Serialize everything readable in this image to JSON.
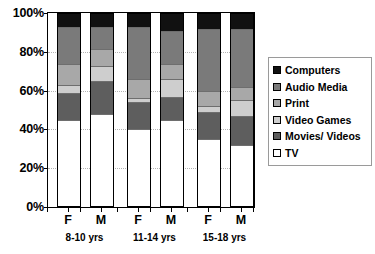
{
  "chart_data": {
    "type": "bar",
    "subtype": "stacked-percentage",
    "title": "",
    "xlabel": "",
    "ylabel": "",
    "ylim": [
      0,
      100
    ],
    "yticks": [
      0,
      20,
      40,
      60,
      80,
      100
    ],
    "ytick_labels": [
      "0%",
      "20%",
      "40%",
      "60%",
      "80%",
      "100%"
    ],
    "grid": true,
    "grid_axis": "y",
    "legend_position": "right",
    "categories": [
      "F",
      "M",
      "F",
      "M",
      "F",
      "M"
    ],
    "groups": [
      {
        "label": "8-10 yrs",
        "members": [
          "F",
          "M"
        ]
      },
      {
        "label": "11-14 yrs",
        "members": [
          "F",
          "M"
        ]
      },
      {
        "label": "15-18 yrs",
        "members": [
          "F",
          "M"
        ]
      }
    ],
    "series": [
      {
        "name": "Computers",
        "color": "#111111",
        "values": [
          7,
          7,
          7,
          9,
          8,
          8
        ]
      },
      {
        "name": "Audio Media",
        "color": "#7a7a7a",
        "values": [
          19,
          11,
          27,
          17,
          32,
          30
        ]
      },
      {
        "name": "Print",
        "color": "#a8a8a8",
        "values": [
          11,
          9,
          10,
          8,
          8,
          7
        ]
      },
      {
        "name": "Video Games",
        "color": "#cecece",
        "values": [
          4,
          8,
          2,
          9,
          3,
          8
        ]
      },
      {
        "name": "Movies/ Videos",
        "color": "#5e5e5e",
        "values": [
          14,
          17,
          14,
          12,
          14,
          15
        ]
      },
      {
        "name": "TV",
        "color": "#ffffff",
        "values": [
          45,
          48,
          40,
          45,
          35,
          32
        ]
      }
    ]
  },
  "legend": {
    "items": [
      {
        "label": "Computers"
      },
      {
        "label": "Audio Media"
      },
      {
        "label": "Print"
      },
      {
        "label": "Video Games"
      },
      {
        "label": "Movies/ Videos"
      },
      {
        "label": "TV"
      }
    ]
  }
}
